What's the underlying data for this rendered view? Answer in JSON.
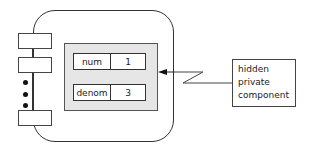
{
  "diagram": {
    "type": "object-encapsulation",
    "object": {
      "interface_tabs_count": 3,
      "ellipsis": "•••"
    },
    "private_fields": [
      {
        "name": "num",
        "value": "1"
      },
      {
        "name": "denom",
        "value": "3"
      }
    ],
    "callout": {
      "lines": [
        "hidden",
        "private",
        "component"
      ]
    },
    "colors": {
      "outline": "#333333",
      "private_fill": "#e6e6e6",
      "background": "#ffffff"
    }
  }
}
